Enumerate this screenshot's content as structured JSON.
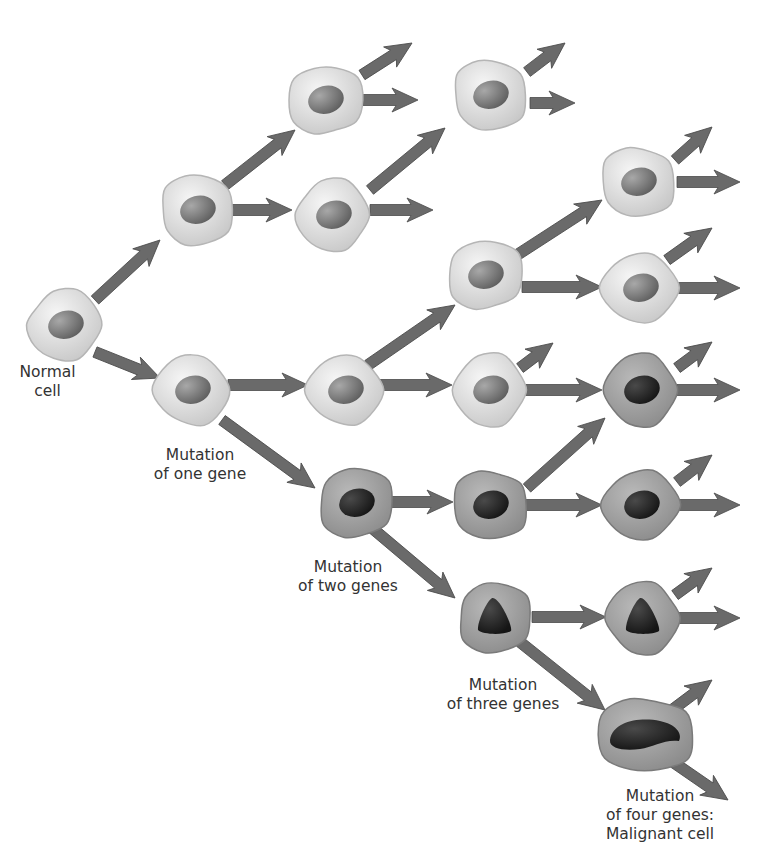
{
  "colors": {
    "arrow": "#6a6a6a",
    "arrow_edge": "#4a4a4a",
    "normal_cell_light": "#f6f6f6",
    "normal_cell_dark": "#c8c8c8",
    "normal_cell_edge": "#b5b5b5",
    "normal_nucleus_light": "#a8a8a8",
    "normal_nucleus_dark": "#5e5e5e",
    "mutant_cell_light": "#b9b9b9",
    "mutant_cell_dark": "#8c8c8c",
    "mutant_cell_edge": "#7a7a7a",
    "mutant_nucleus_light": "#4a4a4a",
    "mutant_nucleus_dark": "#151515",
    "text": "#333333"
  },
  "cells": [
    {
      "id": "normal-cell",
      "x": 65,
      "y": 325,
      "type": "normal",
      "nucleus": "oval"
    },
    {
      "id": "g1-top",
      "x": 197,
      "y": 210,
      "type": "normal",
      "nucleus": "oval"
    },
    {
      "id": "one-gene",
      "x": 192,
      "y": 390,
      "type": "normal",
      "nucleus": "oval"
    },
    {
      "id": "g2-top",
      "x": 325,
      "y": 100,
      "type": "normal",
      "nucleus": "oval"
    },
    {
      "id": "g2-mid",
      "x": 333,
      "y": 215,
      "type": "normal",
      "nucleus": "oval"
    },
    {
      "id": "g3-top",
      "x": 490,
      "y": 95,
      "type": "normal",
      "nucleus": "oval"
    },
    {
      "id": "g2-one",
      "x": 345,
      "y": 390,
      "type": "normal",
      "nucleus": "oval"
    },
    {
      "id": "g3-upper",
      "x": 485,
      "y": 275,
      "type": "normal",
      "nucleus": "oval"
    },
    {
      "id": "g3-one",
      "x": 490,
      "y": 390,
      "type": "normal",
      "nucleus": "oval"
    },
    {
      "id": "g4-a",
      "x": 638,
      "y": 182,
      "type": "normal",
      "nucleus": "oval"
    },
    {
      "id": "g4-b",
      "x": 640,
      "y": 288,
      "type": "normal",
      "nucleus": "oval"
    },
    {
      "id": "two-genes",
      "x": 356,
      "y": 503,
      "type": "mutant",
      "nucleus": "oval"
    },
    {
      "id": "g4-c",
      "x": 641,
      "y": 390,
      "type": "mutant",
      "nucleus": "oval"
    },
    {
      "id": "g3-two",
      "x": 490,
      "y": 505,
      "type": "mutant",
      "nucleus": "oval"
    },
    {
      "id": "g4-d",
      "x": 641,
      "y": 505,
      "type": "mutant",
      "nucleus": "oval"
    },
    {
      "id": "three-genes",
      "x": 495,
      "y": 618,
      "type": "mutant",
      "nucleus": "triangle"
    },
    {
      "id": "g4-e",
      "x": 643,
      "y": 618,
      "type": "mutant",
      "nucleus": "triangle"
    },
    {
      "id": "four-genes",
      "x": 645,
      "y": 735,
      "type": "mutant",
      "nucleus": "blob"
    }
  ],
  "arrows": [
    {
      "x1": 95,
      "y1": 300,
      "x2": 160,
      "y2": 240
    },
    {
      "x1": 95,
      "y1": 352,
      "x2": 160,
      "y2": 378
    },
    {
      "x1": 225,
      "y1": 185,
      "x2": 295,
      "y2": 130
    },
    {
      "x1": 232,
      "y1": 210,
      "x2": 292,
      "y2": 210
    },
    {
      "x1": 362,
      "y1": 75,
      "x2": 412,
      "y2": 43
    },
    {
      "x1": 363,
      "y1": 100,
      "x2": 418,
      "y2": 100
    },
    {
      "x1": 370,
      "y1": 190,
      "x2": 445,
      "y2": 128
    },
    {
      "x1": 370,
      "y1": 210,
      "x2": 433,
      "y2": 210
    },
    {
      "x1": 527,
      "y1": 72,
      "x2": 565,
      "y2": 43
    },
    {
      "x1": 530,
      "y1": 103,
      "x2": 575,
      "y2": 103
    },
    {
      "x1": 228,
      "y1": 385,
      "x2": 308,
      "y2": 385
    },
    {
      "x1": 222,
      "y1": 420,
      "x2": 315,
      "y2": 488
    },
    {
      "x1": 378,
      "y1": 385,
      "x2": 452,
      "y2": 385
    },
    {
      "x1": 368,
      "y1": 365,
      "x2": 455,
      "y2": 305
    },
    {
      "x1": 372,
      "y1": 502,
      "x2": 453,
      "y2": 502
    },
    {
      "x1": 372,
      "y1": 528,
      "x2": 455,
      "y2": 598
    },
    {
      "x1": 517,
      "y1": 255,
      "x2": 602,
      "y2": 200
    },
    {
      "x1": 522,
      "y1": 287,
      "x2": 602,
      "y2": 287
    },
    {
      "x1": 675,
      "y1": 160,
      "x2": 712,
      "y2": 127
    },
    {
      "x1": 677,
      "y1": 182,
      "x2": 740,
      "y2": 182
    },
    {
      "x1": 667,
      "y1": 260,
      "x2": 712,
      "y2": 228
    },
    {
      "x1": 677,
      "y1": 288,
      "x2": 740,
      "y2": 288
    },
    {
      "x1": 520,
      "y1": 368,
      "x2": 553,
      "y2": 343
    },
    {
      "x1": 525,
      "y1": 390,
      "x2": 602,
      "y2": 390
    },
    {
      "x1": 527,
      "y1": 488,
      "x2": 605,
      "y2": 418
    },
    {
      "x1": 522,
      "y1": 505,
      "x2": 602,
      "y2": 505
    },
    {
      "x1": 677,
      "y1": 368,
      "x2": 712,
      "y2": 342
    },
    {
      "x1": 677,
      "y1": 390,
      "x2": 740,
      "y2": 390
    },
    {
      "x1": 677,
      "y1": 482,
      "x2": 712,
      "y2": 455
    },
    {
      "x1": 677,
      "y1": 505,
      "x2": 740,
      "y2": 505
    },
    {
      "x1": 532,
      "y1": 617,
      "x2": 606,
      "y2": 617
    },
    {
      "x1": 520,
      "y1": 642,
      "x2": 605,
      "y2": 710
    },
    {
      "x1": 675,
      "y1": 595,
      "x2": 712,
      "y2": 568
    },
    {
      "x1": 677,
      "y1": 618,
      "x2": 740,
      "y2": 618
    },
    {
      "x1": 672,
      "y1": 710,
      "x2": 712,
      "y2": 680
    },
    {
      "x1": 670,
      "y1": 760,
      "x2": 728,
      "y2": 800
    }
  ],
  "labels": [
    {
      "id": "normal-cell-label",
      "text": "Normal\ncell",
      "x": 5,
      "y": 363,
      "w": 85
    },
    {
      "id": "one-gene-label",
      "text": "Mutation\nof one gene",
      "x": 140,
      "y": 446,
      "w": 120
    },
    {
      "id": "two-genes-label",
      "text": "Mutation\nof two genes",
      "x": 283,
      "y": 558,
      "w": 130
    },
    {
      "id": "three-genes-label",
      "text": "Mutation\nof three genes",
      "x": 433,
      "y": 676,
      "w": 140
    },
    {
      "id": "four-genes-label",
      "text": "Mutation\nof four genes:\nMalignant cell",
      "x": 585,
      "y": 787,
      "w": 150
    }
  ]
}
